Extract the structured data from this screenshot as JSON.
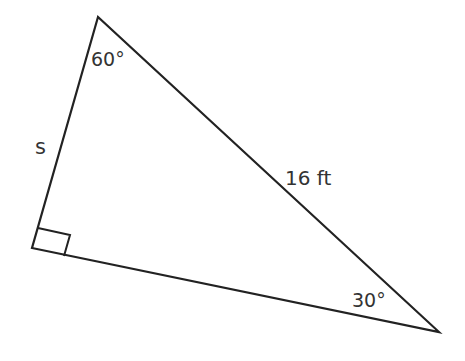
{
  "diagram": {
    "type": "right-triangle",
    "stroke_color": "#222222",
    "label_color": "#333333",
    "vertices": {
      "top": [
        98,
        17
      ],
      "right_angle": [
        32,
        248
      ],
      "bottom_right": [
        439,
        332
      ]
    },
    "labels": {
      "top_angle": "60°",
      "bottom_right_angle": "30°",
      "hypotenuse": "16 ft",
      "left_side": "s"
    }
  }
}
